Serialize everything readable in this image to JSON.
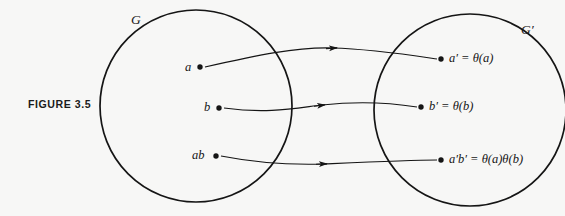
{
  "figure": {
    "caption": "FIGURE  3.5",
    "background_color": "#f7f7f6",
    "ink_color": "#151515",
    "width": 565,
    "height": 216
  },
  "sets": [
    {
      "id": "domain",
      "label": "G",
      "cx": 196,
      "cy": 106,
      "r": 96,
      "label_x": 131,
      "label_y": 14
    },
    {
      "id": "codomain",
      "label": "G′",
      "cx": 470,
      "cy": 110,
      "r": 96,
      "label_x": 521,
      "label_y": 24
    }
  ],
  "elements": {
    "domain_points": [
      {
        "id": "a",
        "label": "a",
        "x": 200,
        "y": 68,
        "label_x": 185,
        "label_y": 62
      },
      {
        "id": "b",
        "label": "b",
        "x": 219,
        "y": 108,
        "label_x": 204,
        "label_y": 102
      },
      {
        "id": "ab",
        "label": "ab",
        "x": 216,
        "y": 156,
        "label_x": 193,
        "label_y": 150
      }
    ],
    "codomain_points": [
      {
        "id": "a-prime",
        "label_main": "a′",
        "label_equals": " = ",
        "label_theta": "θ(",
        "label_arg": "a",
        "label_close": ")",
        "full_label": "a′ = θ(a)",
        "x": 441,
        "y": 59,
        "label_x": 449,
        "label_y": 53
      },
      {
        "id": "b-prime",
        "label_main": "b′",
        "label_equals": " = ",
        "label_theta": "θ(",
        "label_arg": "b",
        "label_close": ")",
        "full_label": "b′ = θ(b)",
        "x": 421,
        "y": 107,
        "label_x": 429,
        "label_y": 101
      },
      {
        "id": "ab-prime",
        "label_main": "a′b′",
        "label_equals": " = ",
        "label_theta": "θ(",
        "label_arg": "a",
        "label_close": ")",
        "label_theta2": "θ(",
        "label_arg2": "b",
        "label_close2": ")",
        "full_label": "a′b′ = θ(a)θ(b)",
        "x": 441,
        "y": 160,
        "label_x": 449,
        "label_y": 154
      }
    ]
  },
  "mappings": [
    {
      "id": "map-a",
      "from": "a",
      "to": "a-prime",
      "path": "M 205 67 C 258 55 296 47 332 48 C 372 49 410 55 437 59",
      "arrow_x": 334,
      "arrow_y": 48.2,
      "arrow_angle": 2
    },
    {
      "id": "map-b",
      "from": "b",
      "to": "b-prime",
      "path": "M 224 108 C 268 114 296 108 322 105 C 358 101 392 103 417 107",
      "arrow_x": 322,
      "arrow_y": 105,
      "arrow_angle": -4
    },
    {
      "id": "map-ab",
      "from": "ab",
      "to": "ab-prime",
      "path": "M 221 156 C 262 164 292 165 324 164 C 368 162 410 160 437 160",
      "arrow_x": 324,
      "arrow_y": 163.8,
      "arrow_angle": -1
    }
  ],
  "icons": {
    "arrowhead": "arrowhead-icon",
    "dot": "point-dot-icon"
  }
}
